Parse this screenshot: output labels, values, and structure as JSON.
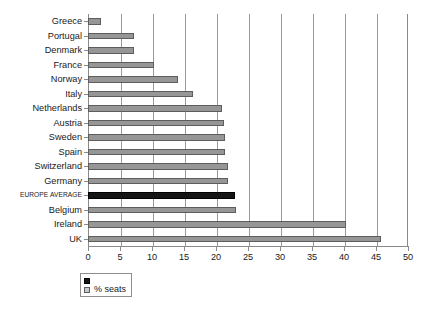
{
  "chart_data": {
    "type": "bar",
    "orientation": "horizontal",
    "title": "",
    "xlabel": "",
    "ylabel": "",
    "xlim": [
      0,
      50
    ],
    "xticks": [
      0,
      5,
      10,
      15,
      20,
      25,
      30,
      35,
      40,
      45,
      50
    ],
    "grid": true,
    "grid_axis": "x",
    "legend_position": "bottom-left",
    "categories": [
      "Greece",
      "Portugal",
      "Denmark",
      "France",
      "Norway",
      "Italy",
      "Netherlands",
      "Austria",
      "Sweden",
      "Spain",
      "Switzerland",
      "Germany",
      "EUROPE AVERAGE",
      "Belgium",
      "Ireland",
      "UK"
    ],
    "series": [
      {
        "name": "% seats",
        "values": [
          2.1,
          7.2,
          7.2,
          10.3,
          14.0,
          16.4,
          21.0,
          21.3,
          21.4,
          21.4,
          21.8,
          21.8,
          23.0,
          23.1,
          40.3,
          45.8
        ]
      }
    ],
    "highlight_category": "EUROPE AVERAGE",
    "colors": {
      "bar_fill": "#969696",
      "bar_edge": "#5d5d5d",
      "highlight_fill": "#151515",
      "highlight_edge": "#000000",
      "grid": "#9a9a9a",
      "axis": "#8a8a8a",
      "text": "#1a1a1a"
    },
    "legend_entries": [
      {
        "label": "",
        "swatch": "dark"
      },
      {
        "label": "% seats",
        "swatch": "light"
      }
    ]
  },
  "caption": ""
}
